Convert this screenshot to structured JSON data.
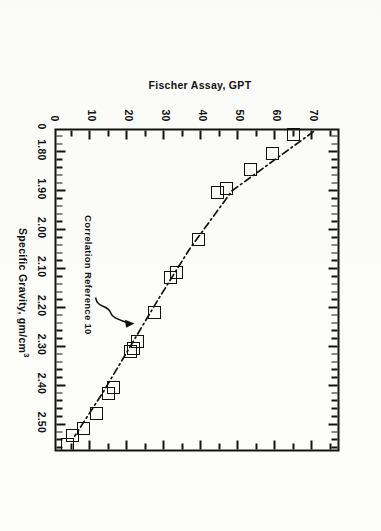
{
  "figure": {
    "annotation": {
      "text": "Correlation Reference 10",
      "target_x": 2.255,
      "target_y": 22.5
    }
  },
  "chart_data": {
    "type": "scatter",
    "title": "",
    "xlabel": "Specific Gravity, gm/cm",
    "xlabel_superscript": "3",
    "ylabel": "Fischer Assay, GPT",
    "xlim": [
      1.745,
      2.575
    ],
    "ylim": [
      0,
      77
    ],
    "x_origin_label": "0",
    "y_origin_label": "0",
    "grid": false,
    "legend": null,
    "x_ticks_major": [
      1.8,
      1.9,
      2.0,
      2.1,
      2.2,
      2.3,
      2.4,
      2.5
    ],
    "x_tick_labels": [
      "1.80",
      "1.90",
      "2.00",
      "2.10",
      "2.20",
      "2.30",
      "2.40",
      "2.50"
    ],
    "x_tick_minor_step": 0.02,
    "y_ticks_major": [
      0,
      10,
      20,
      30,
      40,
      50,
      60,
      70
    ],
    "y_tick_labels": [
      "0",
      "10",
      "20",
      "30",
      "40",
      "50",
      "60",
      "70"
    ],
    "y_tick_minor_step": 5,
    "marker": "open-square",
    "points": [
      {
        "x": 1.755,
        "y": 65.0
      },
      {
        "x": 1.805,
        "y": 59.5
      },
      {
        "x": 1.845,
        "y": 53.5
      },
      {
        "x": 1.893,
        "y": 47.0
      },
      {
        "x": 1.905,
        "y": 44.5
      },
      {
        "x": 2.025,
        "y": 39.5
      },
      {
        "x": 2.11,
        "y": 33.5
      },
      {
        "x": 2.122,
        "y": 32.0
      },
      {
        "x": 2.212,
        "y": 27.5
      },
      {
        "x": 2.288,
        "y": 23.0
      },
      {
        "x": 2.305,
        "y": 22.0
      },
      {
        "x": 2.312,
        "y": 21.0
      },
      {
        "x": 2.405,
        "y": 16.5
      },
      {
        "x": 2.422,
        "y": 15.0
      },
      {
        "x": 2.472,
        "y": 12.0
      },
      {
        "x": 2.51,
        "y": 8.5
      },
      {
        "x": 2.528,
        "y": 5.5
      },
      {
        "x": 2.552,
        "y": 4.0
      }
    ],
    "trend_line": {
      "style": "dash-dot",
      "label": "Correlation Reference 10",
      "x": [
        1.748,
        1.9,
        2.05,
        2.18,
        2.3,
        2.42,
        2.53
      ],
      "y": [
        70.5,
        48.5,
        37.0,
        28.5,
        21.0,
        13.5,
        6.0
      ]
    }
  }
}
